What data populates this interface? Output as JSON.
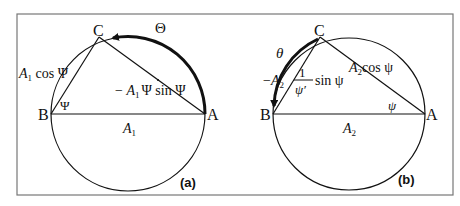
{
  "figure": {
    "panels": [
      {
        "id": "a",
        "label": "(a)",
        "points": {
          "A": "A",
          "B": "B",
          "C": "C"
        },
        "angle_label": "Ψ",
        "arc_label": "Θ",
        "side_BC": {
          "coef": "A",
          "sub": "1",
          "rest": " cos Ψ"
        },
        "side_CA": {
          "prefix": "− ",
          "coef": "A",
          "sub": "1",
          "psi_dot": "Ψ",
          "rest": " sin Ψ"
        },
        "diameter": {
          "coef": "A",
          "sub": "1"
        }
      },
      {
        "id": "b",
        "label": "(b)",
        "points": {
          "A": "A",
          "B": "B",
          "C": "C"
        },
        "angle_label": "ψ",
        "arc_label": "θ",
        "side_CA": {
          "coef": "A",
          "sub": "2",
          "rest": "cos ψ"
        },
        "side_BC": {
          "prefix": "−",
          "coef": "A",
          "sub": "2",
          "num": "1",
          "den": "ψ′",
          "rest": "sin ψ"
        },
        "diameter": {
          "coef": "A",
          "sub": "2"
        }
      }
    ],
    "colors": {
      "stroke": "#111111",
      "frame": "#777777",
      "background": "#ffffff"
    }
  }
}
